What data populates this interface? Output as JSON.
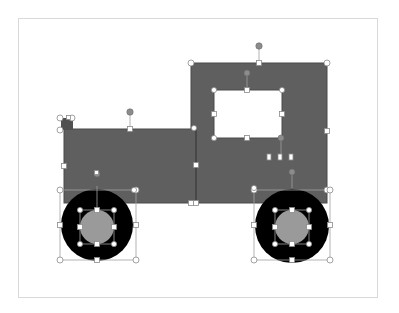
{
  "canvas": {
    "label": "Slide canvas with selected truck drawing",
    "colors": {
      "background": "#ffffff",
      "slide_border": "#d9d9d9",
      "shape_fill": "#5f5f5f",
      "shape_stroke": "#4a4a4a",
      "tire": "#000000",
      "hub": "#9a9a9a",
      "handle_fill": "#ffffff",
      "handle_stroke": "#8a8a8a",
      "rotate_handle": "#8c8c8c",
      "selection_line": "#9a9a9a"
    }
  },
  "shapes": [
    {
      "name": "cab",
      "type": "rectangle",
      "label": "Cab rectangle"
    },
    {
      "name": "window",
      "type": "rectangle",
      "label": "Window rectangle"
    },
    {
      "name": "body",
      "type": "rectangle",
      "label": "Body rectangle"
    },
    {
      "name": "exhaust",
      "type": "small-shape",
      "label": "Small exhaust shape"
    },
    {
      "name": "wheel-left",
      "type": "donut",
      "label": "Left wheel"
    },
    {
      "name": "wheel-right",
      "type": "donut",
      "label": "Right wheel"
    },
    {
      "name": "hub-left",
      "type": "circle",
      "label": "Left hub"
    },
    {
      "name": "hub-right",
      "type": "circle",
      "label": "Right hub"
    }
  ]
}
